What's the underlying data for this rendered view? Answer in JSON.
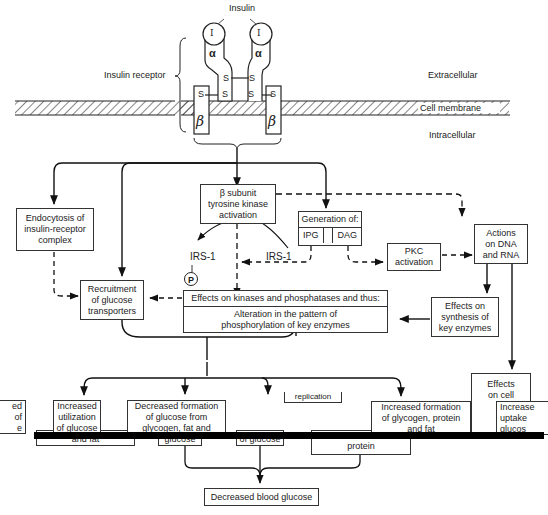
{
  "labels": {
    "insulin": "Insulin",
    "insulin_symbol": "I",
    "alpha": "α",
    "beta": "β",
    "disulfide": "S",
    "insulin_receptor": "Insulin receptor",
    "extracellular": "Extracellular",
    "cell_membrane": "Cell membrane",
    "intracellular": "Intracellular",
    "irs1_left": "IRS-1",
    "irs1_right": "IRS-1",
    "phospho": "P"
  },
  "boxes": {
    "endocytosis": [
      "Endocytosis of",
      "insulin-receptor",
      "complex"
    ],
    "beta_subunit": [
      "β subunit",
      "tyrosine kinase",
      "activation"
    ],
    "generation": {
      "title": "Generation of:",
      "left": "IPG",
      "right": "DAG"
    },
    "pkc": [
      "PKC",
      "activation"
    ],
    "actions_dna": [
      "Actions",
      "on DNA",
      "and RNA"
    ],
    "recruitment": [
      "Recruitment",
      "of glucose",
      "transporters"
    ],
    "effects_kinases": {
      "title": "Effects on kinases and phosphatases and thus:",
      "body": [
        "Alteration in the pattern of",
        "phosphorylation of key enzymes"
      ]
    },
    "effects_synthesis": [
      "Effects on",
      "synthesis of",
      "key enzymes"
    ],
    "effects_cell": [
      "Effects",
      "on cell"
    ],
    "partial_left": [
      "ed",
      "of",
      "e"
    ],
    "increased_utilization": [
      "Increased",
      "utilization",
      "of glucose"
    ],
    "utilization_under": "and fat",
    "decreased_formation": [
      "Decreased formation",
      "of glucose from",
      "glycogen, fat and"
    ],
    "decreased_under": "glucose",
    "glucose_partial": "of glucose",
    "replication_partial": "replication",
    "protein_partial": "protein",
    "increased_formation": [
      "Increased formation",
      "of glycogen, protein",
      "and fat"
    ],
    "increased_uptake": [
      "Increase",
      "uptake",
      "glucos"
    ],
    "decreased_blood_glucose": "Decreased blood glucose"
  }
}
